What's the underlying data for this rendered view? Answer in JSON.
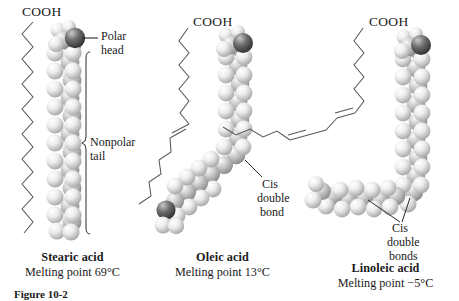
{
  "figure": {
    "caption": "Figure 10-2",
    "molecules": [
      {
        "id": "stearic",
        "formula_label": "COOH",
        "name": "Stearic acid",
        "melting_point": "Melting point 69°C",
        "annotations": [
          {
            "key": "polar-head",
            "line1": "Polar",
            "line2": "head"
          },
          {
            "key": "nonpolar-tail",
            "line1": "Nonpolar",
            "line2": "tail"
          }
        ]
      },
      {
        "id": "oleic",
        "formula_label": "COOH",
        "name": "Oleic acid",
        "melting_point": "Melting point 13°C",
        "annotations": [
          {
            "key": "cis-double-bond",
            "line1": "Cis",
            "line2": "double",
            "line3": "bond"
          }
        ]
      },
      {
        "id": "linoleic",
        "formula_label": "COOH",
        "name": "Linoleic acid",
        "melting_point": "Melting point −5°C",
        "annotations": [
          {
            "key": "cis-double-bonds",
            "line1": "Cis",
            "line2": "double",
            "line3": "bonds"
          }
        ]
      }
    ]
  },
  "colors": {
    "ink": "#1a1a1a",
    "line": "#4a4a4a",
    "atom_light": "#f2f2f2",
    "atom_mid": "#bdbdbd",
    "atom_dark": "#5a5a5a"
  }
}
